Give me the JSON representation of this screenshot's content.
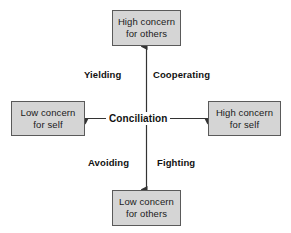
{
  "diagram": {
    "center_label": "Conciliation",
    "colors": {
      "box_fill": "#d5d5d5",
      "box_border": "#5a5a5a",
      "arrow": "#333333",
      "text": "#1a1a1a",
      "background": "#ffffff"
    },
    "nodes": {
      "top": {
        "line1": "High concern",
        "line2": "for others"
      },
      "left": {
        "line1": "Low concern",
        "line2": "for self"
      },
      "right": {
        "line1": "High concern",
        "line2": "for self"
      },
      "bottom": {
        "line1": "Low concern",
        "line2": "for others"
      }
    },
    "quadrants": {
      "upper_left": "Yielding",
      "upper_right": "Cooperating",
      "lower_left": "Avoiding",
      "lower_right": "Fighting"
    },
    "axes": {
      "vertical": {
        "name": "concern-for-others-axis",
        "low_end": "bottom",
        "high_end": "top",
        "double_headed": true
      },
      "horizontal": {
        "name": "concern-for-self-axis",
        "low_end": "left",
        "high_end": "right",
        "double_headed": true
      }
    }
  }
}
